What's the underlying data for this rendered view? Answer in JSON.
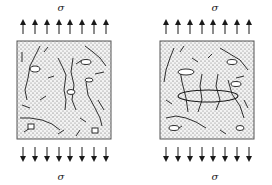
{
  "figure": {
    "panels": [
      {
        "id": "left",
        "top_label": "σ",
        "bottom_label": "σ",
        "arrow_count_top": 8,
        "arrow_count_bottom": 8,
        "description": "Stressed material block with dispersed microcracks and voids"
      },
      {
        "id": "right",
        "top_label": "σ",
        "bottom_label": "σ",
        "arrow_count_top": 8,
        "arrow_count_bottom": 8,
        "description": "Stressed material block with microcracks coalescing into a large central crack"
      }
    ],
    "colors": {
      "stroke": "#1a1a1a",
      "fill_dots": "#555555",
      "background": "#ffffff"
    }
  }
}
